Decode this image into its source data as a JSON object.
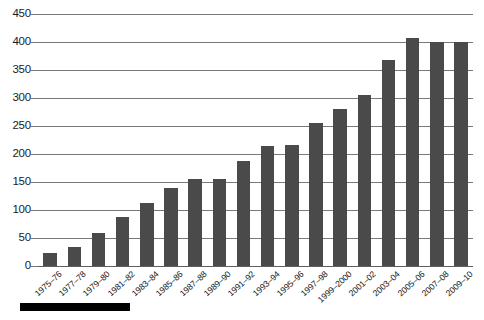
{
  "chart_data": {
    "type": "bar",
    "title": "",
    "subtitle": "",
    "xlabel": "",
    "ylabel": "",
    "categories": [
      "1975–76",
      "1977–78",
      "1979–80",
      "1981–82",
      "1983–84",
      "1985–86",
      "1987–88",
      "1989–90",
      "1991–92",
      "1993–94",
      "1995–96",
      "1997–98",
      "1999–2000",
      "2001–02",
      "2003–04",
      "2005–06",
      "2007–08",
      "2009–10"
    ],
    "values": [
      23,
      34,
      59,
      87,
      112,
      139,
      156,
      156,
      188,
      215,
      216,
      256,
      280,
      306,
      368,
      408,
      400,
      400
    ],
    "ylim": [
      0,
      450
    ],
    "ytick_labels": [
      "0",
      "50",
      "100",
      "150",
      "200",
      "250",
      "300",
      "350",
      "400",
      "450"
    ],
    "ytick_values": [
      0,
      50,
      100,
      150,
      200,
      250,
      300,
      350,
      400,
      450
    ],
    "grid": true,
    "legend": [],
    "legend_position": "none",
    "bar_color": "#4a4a4a",
    "gridline_color": "#76797c",
    "background_color": "#ffffff"
  },
  "decorations": {
    "source_rule_color": "#000000"
  }
}
